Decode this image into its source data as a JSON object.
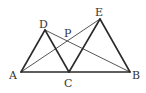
{
  "diagram": {
    "type": "geometry",
    "points": {
      "A": {
        "label": "A",
        "x": 21,
        "y": 72
      },
      "C": {
        "label": "C",
        "x": 69,
        "y": 72
      },
      "B": {
        "label": "B",
        "x": 130,
        "y": 72
      },
      "D": {
        "label": "D",
        "x": 45,
        "y": 30
      },
      "E": {
        "label": "E",
        "x": 100,
        "y": 19
      },
      "P": {
        "label": "P",
        "x": 67,
        "y": 41
      }
    },
    "segments": [
      {
        "from": "A",
        "to": "B",
        "weight": "thick"
      },
      {
        "from": "A",
        "to": "D",
        "weight": "thick"
      },
      {
        "from": "D",
        "to": "C",
        "weight": "thick"
      },
      {
        "from": "C",
        "to": "E",
        "weight": "thick"
      },
      {
        "from": "E",
        "to": "B",
        "weight": "thick"
      },
      {
        "from": "A",
        "to": "E",
        "weight": "thin"
      },
      {
        "from": "D",
        "to": "B",
        "weight": "thin"
      }
    ],
    "colors": {
      "line": "#2a2a2a",
      "label": "#333333",
      "background": "#ffffff"
    }
  }
}
